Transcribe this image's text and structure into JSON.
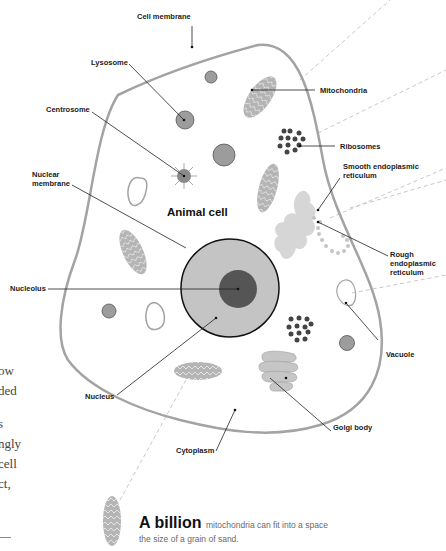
{
  "diagram": {
    "title": "Animal cell",
    "labels": {
      "cell_membrane": "Cell membrane",
      "lysosome": "Lysosome",
      "centrosome": "Centrosome",
      "nuclear_membrane_1": "Nuclear",
      "nuclear_membrane_2": "membrane",
      "nucleolus": "Nucleolus",
      "nucleus": "Nucleus",
      "cytoplasm": "Cytoplasm",
      "mitochondria": "Mitochondria",
      "ribosomes": "Ribosomes",
      "smooth_er_1": "Smooth endoplasmic",
      "smooth_er_2": "reticulum",
      "rough_er_1": "Rough",
      "rough_er_2": "endoplasmic",
      "rough_er_3": "reticulum",
      "vacuole": "Vacuole",
      "golgi_body": "Golgi body"
    },
    "colors": {
      "membrane": "#a3a3a3",
      "organelle_fill": "#9c9c9c",
      "nucleus_fill": "#c4c4c4",
      "nucleolus_fill": "#555555",
      "ribosome": "#444444",
      "er_fill": "#d6d6d6",
      "leader_line": "#222222",
      "dashed_line": "#c8c8c8"
    }
  },
  "side_text": {
    "lines": [
      "ow",
      "ded",
      "",
      "s",
      "ngly",
      "cell",
      "ct,"
    ]
  },
  "fact": {
    "highlight": "A billion",
    "rest_line1": "mitochondria can fit into a space",
    "line2": "the size of a grain of sand."
  }
}
